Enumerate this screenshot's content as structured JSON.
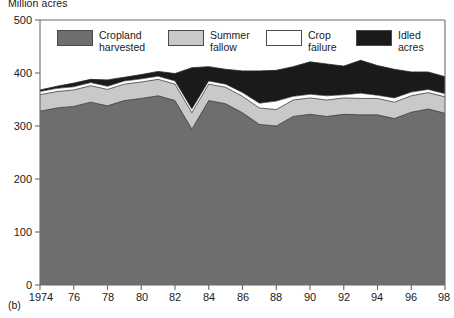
{
  "figure": {
    "unit_label": "Million acres",
    "panel_label": "(b)"
  },
  "legend": {
    "items": [
      {
        "label": "Cropland\nharvested",
        "name": "cropland-harvested",
        "color": "#6e6e6e"
      },
      {
        "label": "Summer\nfallow",
        "name": "summer-fallow",
        "color": "#c9c9c9"
      },
      {
        "label": "Crop\nfailure",
        "name": "crop-failure",
        "color": "#ffffff"
      },
      {
        "label": "Idled\nacres",
        "name": "idled-acres",
        "color": "#1a1a1a"
      }
    ]
  },
  "axes": {
    "y_ticks": [
      "0",
      "100",
      "200",
      "300",
      "400",
      "500"
    ],
    "x_ticks": [
      "1974",
      "76",
      "78",
      "80",
      "82",
      "84",
      "86",
      "88",
      "90",
      "92",
      "94",
      "96",
      "98"
    ]
  },
  "chart_data": {
    "type": "area",
    "title": "",
    "subtitle": "",
    "xlabel": "",
    "ylabel": "Million acres",
    "ylim": [
      0,
      500
    ],
    "xlim": [
      1974,
      1998
    ],
    "grid": false,
    "legend_position": "top-inside",
    "stacked": true,
    "x": [
      1974,
      1975,
      1976,
      1977,
      1978,
      1979,
      1980,
      1981,
      1982,
      1983,
      1984,
      1985,
      1986,
      1987,
      1988,
      1989,
      1990,
      1991,
      1992,
      1993,
      1994,
      1995,
      1996,
      1997,
      1998
    ],
    "x_tick_values": [
      1974,
      1976,
      1978,
      1980,
      1982,
      1984,
      1986,
      1988,
      1990,
      1992,
      1994,
      1996,
      1998
    ],
    "y_tick_values": [
      0,
      100,
      200,
      300,
      400,
      500
    ],
    "series": [
      {
        "name": "Cropland harvested",
        "color": "#6e6e6e",
        "values": [
          328,
          334,
          337,
          345,
          338,
          348,
          352,
          357,
          348,
          294,
          348,
          342,
          325,
          303,
          300,
          318,
          322,
          318,
          322,
          321,
          321,
          314,
          326,
          332,
          324
        ]
      },
      {
        "name": "Summer fallow",
        "color": "#c9c9c9",
        "values": [
          31,
          31,
          31,
          31,
          31,
          31,
          31,
          31,
          31,
          31,
          31,
          31,
          31,
          31,
          31,
          31,
          31,
          31,
          31,
          31,
          31,
          31,
          31,
          31,
          31
        ]
      },
      {
        "name": "Crop failure",
        "color": "#ffffff",
        "values": [
          6,
          6,
          6,
          6,
          6,
          6,
          6,
          6,
          6,
          7,
          6,
          6,
          7,
          9,
          16,
          7,
          7,
          8,
          6,
          10,
          6,
          8,
          7,
          6,
          6
        ]
      },
      {
        "name": "Idled acres",
        "color": "#1a1a1a",
        "values": [
          3,
          4,
          7,
          6,
          12,
          7,
          8,
          9,
          14,
          78,
          27,
          28,
          41,
          61,
          58,
          56,
          61,
          60,
          54,
          62,
          56,
          54,
          38,
          33,
          32
        ]
      }
    ],
    "series_totals": [
      368,
      375,
      381,
      388,
      387,
      392,
      397,
      403,
      399,
      410,
      412,
      407,
      404,
      404,
      405,
      412,
      421,
      417,
      413,
      424,
      414,
      407,
      402,
      402,
      393
    ],
    "annotations": [
      {
        "text": "(b)",
        "position": "below-axis-left"
      }
    ]
  }
}
